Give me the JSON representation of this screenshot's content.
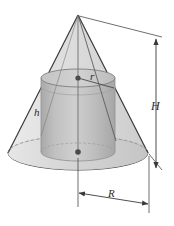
{
  "figure": {
    "background_color": "#ffffff",
    "line_color": "#3a3a3a",
    "cone_fill_color": "#d3d3d3",
    "cone_base_fill_color": "#c4c4c4",
    "cylinder_fill_color": "#b9b9b9",
    "cylinder_top_fill_color": "#c9c9c9",
    "labels": {
      "cylinder_radius": "r",
      "cylinder_height": "h",
      "cone_height": "H",
      "cone_radius": "R"
    },
    "geometry": {
      "apex_x": 78,
      "apex_y": 15,
      "base_center_x": 78,
      "base_center_y": 153,
      "base_radius_x": 70,
      "base_radius_y": 17,
      "cyl_center_x": 78,
      "cyl_top_y": 78,
      "cyl_bottom_y": 152,
      "cyl_radius_x": 37,
      "cyl_radius_y": 9
    },
    "dimension_lines": [
      {
        "name": "cone-height-dimension",
        "label": "H",
        "orientation": "vertical"
      },
      {
        "name": "cone-radius-dimension",
        "label": "R",
        "orientation": "horizontal"
      }
    ],
    "markers": [
      {
        "name": "cylinder-top-center-dot"
      },
      {
        "name": "cone-base-center-dot"
      }
    ]
  }
}
